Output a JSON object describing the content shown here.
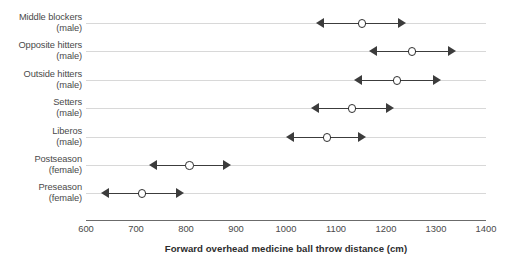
{
  "chart_data": {
    "type": "scatter",
    "title": "",
    "subtitle": "",
    "xlabel": "Forward overhead medicine ball throw distance (cm)",
    "ylabel": "",
    "xlim": [
      600,
      1400
    ],
    "xticks": [
      600,
      700,
      800,
      900,
      1000,
      1100,
      1200,
      1300,
      1400
    ],
    "xtick_labels": [
      "600",
      "700",
      "800",
      "900",
      "1000",
      "1100",
      "1200",
      "1300",
      "1400"
    ],
    "grid": true,
    "legend": "none",
    "orientation": "horizontal",
    "marker_style": "open-circle",
    "error_style": "double-headed-arrow",
    "categories": [
      "Middle blockers (male)",
      "Opposite hitters (male)",
      "Outside hitters (male)",
      "Setters (male)",
      "Liberos (male)",
      "Postseason (female)",
      "Preseason (female)"
    ],
    "series": [
      {
        "name": "Forward overhead medicine ball throw distance",
        "values": [
          1150,
          1250,
          1220,
          1130,
          1080,
          805,
          710
        ],
        "low": [
          1060,
          1165,
          1135,
          1050,
          1000,
          725,
          630
        ],
        "high": [
          1240,
          1340,
          1310,
          1215,
          1160,
          890,
          795
        ]
      }
    ],
    "points": [
      {
        "category": "Middle blockers",
        "group": "(male)",
        "value": 1150,
        "low": 1060,
        "high": 1240
      },
      {
        "category": "Opposite hitters",
        "group": "(male)",
        "value": 1250,
        "low": 1165,
        "high": 1340
      },
      {
        "category": "Outside hitters",
        "group": "(male)",
        "value": 1220,
        "low": 1135,
        "high": 1310
      },
      {
        "category": "Setters",
        "group": "(male)",
        "value": 1130,
        "low": 1050,
        "high": 1215
      },
      {
        "category": "Liberos",
        "group": "(male)",
        "value": 1080,
        "low": 1000,
        "high": 1160
      },
      {
        "category": "Postseason",
        "group": "(female)",
        "value": 805,
        "low": 725,
        "high": 890
      },
      {
        "category": "Preseason",
        "group": "(female)",
        "value": 710,
        "low": 630,
        "high": 795
      }
    ],
    "colors": {
      "marker_fill": "#ffffff",
      "marker_edge": "#2f2f2f",
      "error_bar": "#3c3c3c",
      "gridline": "#d8d8d8",
      "axis": "#6b6b6b",
      "text": "#4a4a4a"
    }
  },
  "axis": {
    "x_title": "Forward overhead medicine ball throw distance (cm)"
  }
}
